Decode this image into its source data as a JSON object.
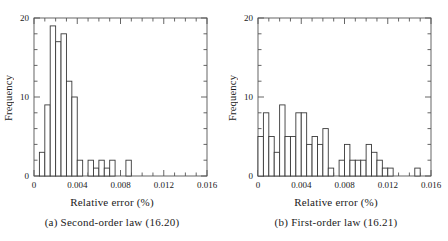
{
  "figure": {
    "panel_count": 2
  },
  "chart_data": [
    {
      "type": "bar",
      "panel_id": "panel-a",
      "title": "",
      "caption": "(a) Second-order law (16.20)",
      "xlabel": "Relative error (%)",
      "ylabel": "Frequency",
      "xlim": [
        0,
        0.016
      ],
      "ylim": [
        0,
        20
      ],
      "xticks": [
        0,
        0.004,
        0.008,
        0.012,
        0.016
      ],
      "xtick_labels": [
        "0",
        "0.004",
        "0.008",
        "0.012",
        "0.016"
      ],
      "yticks": [
        0,
        10,
        20
      ],
      "ytick_labels": [
        "0",
        "10",
        "20"
      ],
      "x_minor_tick_step": 0.001,
      "y_minor_tick_step": 2,
      "grid": false,
      "legend": "none",
      "bin_width": 0.0005,
      "bin_left_edges": [
        0.0005,
        0.001,
        0.0015,
        0.002,
        0.0025,
        0.003,
        0.0035,
        0.004,
        0.0045,
        0.005,
        0.0055,
        0.006,
        0.0065,
        0.007,
        0.0075,
        0.008,
        0.0085
      ],
      "values": [
        3,
        9,
        19,
        17,
        18,
        12,
        10,
        2,
        0,
        2,
        1,
        2,
        1,
        2,
        0,
        0,
        2
      ],
      "bar_fill": "#ffffff",
      "bar_edge": "#3a3a3a"
    },
    {
      "type": "bar",
      "panel_id": "panel-b",
      "title": "",
      "caption": "(b) First-order law (16.21)",
      "xlabel": "Relative error (%)",
      "ylabel": "Frequency",
      "xlim": [
        0,
        0.016
      ],
      "ylim": [
        0,
        20
      ],
      "xticks": [
        0,
        0.004,
        0.008,
        0.012,
        0.016
      ],
      "xtick_labels": [
        "0",
        "0.004",
        "0.008",
        "0.012",
        "0.016"
      ],
      "yticks": [
        0,
        10,
        20
      ],
      "ytick_labels": [
        "0",
        "10",
        "20"
      ],
      "x_minor_tick_step": 0.001,
      "y_minor_tick_step": 2,
      "grid": false,
      "legend": "none",
      "bin_width": 0.0005,
      "bin_left_edges": [
        0.0,
        0.0005,
        0.001,
        0.0015,
        0.002,
        0.0025,
        0.003,
        0.0035,
        0.004,
        0.0045,
        0.005,
        0.0055,
        0.006,
        0.0065,
        0.007,
        0.0075,
        0.008,
        0.0085,
        0.009,
        0.0095,
        0.01,
        0.0105,
        0.011,
        0.0115,
        0.012,
        0.0125,
        0.013,
        0.0135,
        0.014,
        0.0145,
        0.015
      ],
      "values": [
        5,
        8,
        5,
        3,
        9,
        5,
        5,
        8,
        8,
        4,
        5,
        4,
        6,
        1,
        0,
        2,
        4,
        2,
        2,
        2,
        4,
        3,
        2,
        1,
        1,
        0,
        0,
        0,
        0,
        1,
        0
      ],
      "bar_fill": "#ffffff",
      "bar_edge": "#3a3a3a"
    }
  ],
  "style": {
    "axis_color": "#555555",
    "text_color": "#1a1a1a",
    "background": "#ffffff"
  }
}
